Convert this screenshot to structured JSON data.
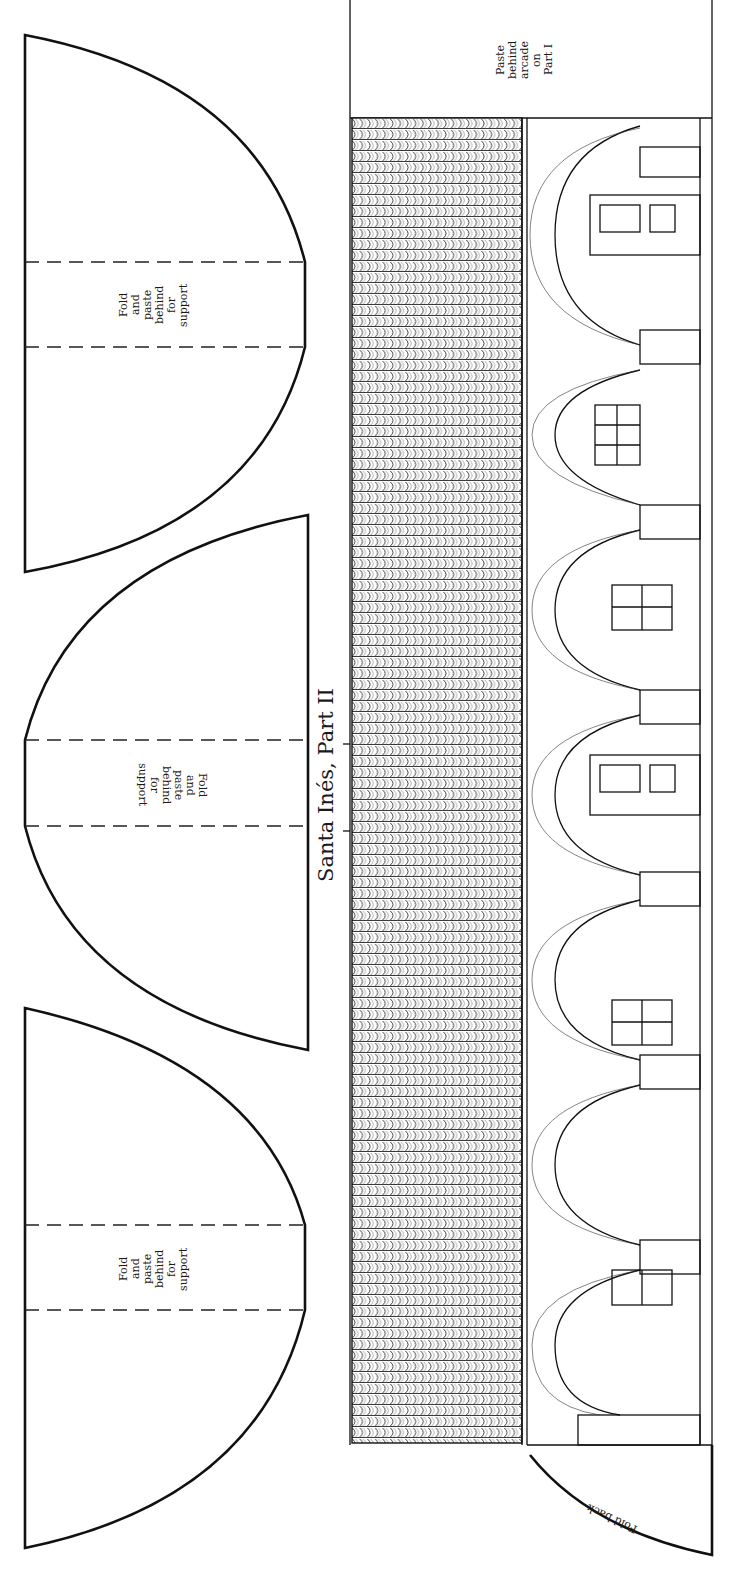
{
  "sheet": {
    "title": "Santa Inés, Part II",
    "colors": {
      "ink": "#111111",
      "paper": "#ffffff"
    }
  },
  "support_pieces": [
    {
      "id": "support-top",
      "label": "Fold\nand\npaste\nbehind\nfor\nsupport"
    },
    {
      "id": "support-middle",
      "label": "Fold\nand\npaste\nbehind\nfor\nsupport"
    },
    {
      "id": "support-bottom",
      "label": "Fold\nand\npaste\nbehind\nfor\nsupport"
    }
  ],
  "tab_label": "Paste\nbehind\narcade\non\nPart I",
  "fold_label": "Fold back",
  "arcade": {
    "arch_count": 7,
    "column_count": 7
  }
}
